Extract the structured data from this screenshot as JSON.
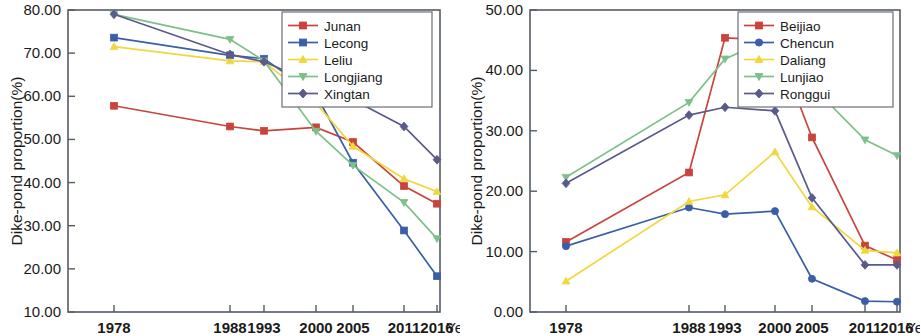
{
  "figure": {
    "panels": [
      "left",
      "right"
    ]
  },
  "chart_data": [
    {
      "type": "line",
      "panel": "left",
      "title": "",
      "xlabel": "Year",
      "ylabel": "Dike-pond proportion(%)",
      "categories": [
        "1978",
        "1988",
        "1993",
        "2000",
        "2005",
        "2011",
        "2016"
      ],
      "x": [
        1978,
        1988,
        1993,
        2000,
        2005,
        2011,
        2016
      ],
      "ylim": [
        10.0,
        80.0
      ],
      "yticks": [
        "10.00",
        "20.00",
        "30.00",
        "40.00",
        "50.00",
        "60.00",
        "70.00",
        "80.00"
      ],
      "ytick_values": [
        10,
        20,
        30,
        40,
        50,
        60,
        70,
        80
      ],
      "grid": false,
      "legend_position": "top-right",
      "series": [
        {
          "name": "Junan",
          "color": "#c8443c",
          "marker": "square",
          "values": [
            57.8,
            53.0,
            52.0,
            52.8,
            49.4,
            39.2,
            35.1
          ]
        },
        {
          "name": "Lecong",
          "color": "#3a5fa8",
          "marker": "square",
          "values": [
            73.6,
            69.5,
            68.7,
            60.4,
            44.6,
            28.9,
            18.3
          ]
        },
        {
          "name": "Leliu",
          "color": "#f0d83c",
          "marker": "triangle-up",
          "values": [
            71.5,
            68.2,
            68.0,
            58.4,
            48.4,
            40.9,
            37.9
          ]
        },
        {
          "name": "Longjiang",
          "color": "#7ec08a",
          "marker": "triangle-down",
          "values": [
            79.0,
            73.2,
            68.2,
            51.9,
            44.0,
            35.4,
            27.0
          ]
        },
        {
          "name": "Xingtan",
          "color": "#5a5a8c",
          "marker": "diamond",
          "values": [
            79.0,
            69.7,
            68.0,
            62.9,
            59.2,
            53.0,
            45.3
          ]
        }
      ]
    },
    {
      "type": "line",
      "panel": "right",
      "title": "",
      "xlabel": "Year",
      "ylabel": "Dike-pond proportion(%)",
      "categories": [
        "1978",
        "1988",
        "1993",
        "2000",
        "2005",
        "2011",
        "2016"
      ],
      "x": [
        1978,
        1988,
        1993,
        2000,
        2005,
        2011,
        2016
      ],
      "ylim": [
        0.0,
        50.0
      ],
      "yticks": [
        "0.00",
        "10.00",
        "20.00",
        "30.00",
        "40.00",
        "50.00"
      ],
      "ytick_values": [
        0,
        10,
        20,
        30,
        40,
        50
      ],
      "grid": false,
      "legend_position": "top-right",
      "series": [
        {
          "name": "Beijiao",
          "color": "#c8443c",
          "marker": "square",
          "values": [
            11.6,
            23.1,
            45.4,
            45.0,
            28.9,
            11.0,
            8.6
          ]
        },
        {
          "name": "Chencun",
          "color": "#3a5fa8",
          "marker": "circle",
          "values": [
            10.9,
            17.3,
            16.2,
            16.7,
            5.5,
            1.8,
            1.7
          ]
        },
        {
          "name": "Daliang",
          "color": "#f0d83c",
          "marker": "triangle-up",
          "values": [
            5.1,
            18.3,
            19.4,
            26.5,
            17.4,
            10.2,
            9.8
          ]
        },
        {
          "name": "Lunjiao",
          "color": "#7ec08a",
          "marker": "triangle-down",
          "values": [
            22.3,
            34.7,
            41.9,
            45.6,
            37.4,
            28.5,
            25.9
          ]
        },
        {
          "name": "Ronggui",
          "color": "#5a5a8c",
          "marker": "diamond",
          "values": [
            21.3,
            32.6,
            33.9,
            33.3,
            18.9,
            7.8,
            7.8
          ]
        }
      ]
    }
  ]
}
